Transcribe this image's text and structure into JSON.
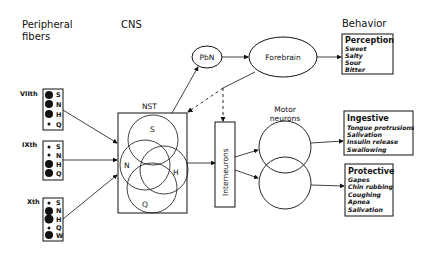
{
  "headers": {
    "peripheral_line1": "Peripheral",
    "peripheral_line2": "fibers",
    "cns": "CNS",
    "behavior": "Behavior"
  },
  "nerves": [
    {
      "label": "VIIth",
      "rows": [
        {
          "letter": "S",
          "dot": "large"
        },
        {
          "letter": "N",
          "dot": "large"
        },
        {
          "letter": "H",
          "dot": "large"
        },
        {
          "letter": "Q",
          "dot": "small"
        }
      ]
    },
    {
      "label": "IXth",
      "rows": [
        {
          "letter": "S",
          "dot": "small"
        },
        {
          "letter": "N",
          "dot": "small"
        },
        {
          "letter": "H",
          "dot": "large"
        },
        {
          "letter": "Q",
          "dot": "large"
        }
      ]
    },
    {
      "label": "Xth",
      "rows": [
        {
          "letter": "S",
          "dot": "small"
        },
        {
          "letter": "N",
          "dot": "large"
        },
        {
          "letter": "H",
          "dot": "large"
        },
        {
          "letter": "Q",
          "dot": "small"
        },
        {
          "letter": "W",
          "dot": "large"
        }
      ]
    }
  ],
  "nst": {
    "title": "NST",
    "circles": [
      "S",
      "N",
      "H",
      "Q"
    ]
  },
  "pbn": "PbN",
  "forebrain": "Forebrain",
  "interneurons": "Interneurons",
  "motor_line1": "Motor",
  "motor_line2": "neurons",
  "behaviors": {
    "perception": {
      "title": "Perception",
      "items": [
        "Sweet",
        "Salty",
        "Sour",
        "Bitter"
      ]
    },
    "ingestive": {
      "title": "Ingestive",
      "items": [
        "Tongue protrusions",
        "Salivation",
        "Insulin release",
        "Swallowing"
      ]
    },
    "protective": {
      "title": "Protective",
      "items": [
        "Gapes",
        "Chin rubbing",
        "Coughing",
        "Apnea",
        "Salivation"
      ]
    }
  }
}
